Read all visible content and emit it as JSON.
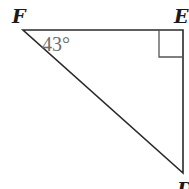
{
  "diagram": {
    "type": "right-triangle",
    "vertices": {
      "F": {
        "label": "F",
        "x": 23,
        "y": 30
      },
      "E": {
        "label": "E",
        "x": 183,
        "y": 30
      },
      "D": {
        "label": "D",
        "x": 183,
        "y": 173
      }
    },
    "angle_label": "43°",
    "angle_at": "F",
    "right_angle_at": "E",
    "colors": {
      "stroke": "#2a2a2a",
      "angle_text": "#6e6e6e",
      "right_angle_marker": "#555555"
    }
  }
}
